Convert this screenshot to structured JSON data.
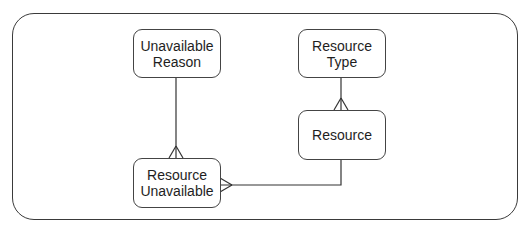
{
  "diagram": {
    "type": "entity-relationship",
    "entities": [
      {
        "id": "unavailable_reason",
        "label": "Unavailable\nReason"
      },
      {
        "id": "resource_type",
        "label": "Resource\nType"
      },
      {
        "id": "resource",
        "label": "Resource"
      },
      {
        "id": "resource_unavailable",
        "label": "Resource\nUnavailable"
      }
    ],
    "relationships": [
      {
        "from": "unavailable_reason",
        "to": "resource_unavailable",
        "from_cardinality": "one",
        "to_cardinality": "many"
      },
      {
        "from": "resource_type",
        "to": "resource",
        "from_cardinality": "one",
        "to_cardinality": "many"
      },
      {
        "from": "resource",
        "to": "resource_unavailable",
        "from_cardinality": "one",
        "to_cardinality": "many"
      }
    ],
    "colors": {
      "line": "#333333",
      "border": "#444444",
      "background": "#ffffff",
      "text": "#1e1e1e"
    }
  }
}
